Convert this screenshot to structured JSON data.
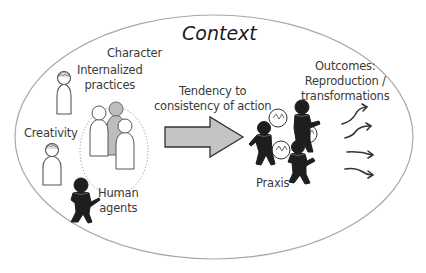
{
  "diagram": {
    "title": "Context",
    "labels": {
      "character": "Character",
      "internalized_line1": "Internalized",
      "internalized_line2": "practices",
      "creativity": "Creativity",
      "human_line1": "Human",
      "human_line2": "agents",
      "tendency_line1": "Tendency to",
      "tendency_line2": "consistency of action",
      "praxis": "Praxis",
      "outcomes_line1": "Outcomes:",
      "outcomes_line2": "Reproduction /",
      "outcomes_line3": "transformations"
    },
    "colors": {
      "ellipse_stroke": "#a8a8a8",
      "figure_outline": "#555555",
      "figure_gray": "#bdbdbd",
      "agent_fill": "#1e1e1e",
      "arrow_fill": "#c4c4c4",
      "arrow_stroke": "#333333",
      "text": "#3a3a3a"
    },
    "nodes": [
      {
        "id": "context",
        "shape": "ellipse"
      },
      {
        "id": "internalized-practices-figure",
        "shape": "pawn-with-brain"
      },
      {
        "id": "creativity-figure",
        "shape": "pawn-with-brain"
      },
      {
        "id": "character-group",
        "shape": "three-pawns-in-dotted-ellipse"
      },
      {
        "id": "human-agent",
        "shape": "black-walking-figure"
      },
      {
        "id": "praxis-group",
        "shape": "three-interacting-black-figures"
      },
      {
        "id": "outcome-arrows",
        "shape": "four-curvy-arrows"
      }
    ],
    "edges": [
      {
        "from": "character-group",
        "to": "praxis-group",
        "label": "Tendency to consistency of action"
      },
      {
        "from": "praxis-group",
        "to": "outcomes",
        "label": "Outcomes: Reproduction / transformations"
      }
    ]
  }
}
